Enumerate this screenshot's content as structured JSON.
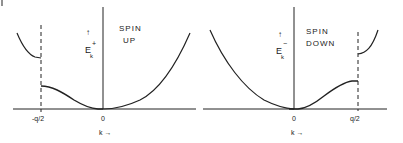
{
  "figure": {
    "corner_mark": "|",
    "left_panel": {
      "title_line1": "SPIN",
      "title_line2": "UP",
      "y_label": "E",
      "y_label_sup": "+",
      "y_label_sub": "k",
      "y_arrow": "↑",
      "x_tick_left": "-q/2",
      "x_tick_origin": "0",
      "x_label": "k →"
    },
    "right_panel": {
      "title_line1": "SPIN",
      "title_line2": "DOWN",
      "y_label": "E",
      "y_label_sup": "−",
      "y_label_sub": "k",
      "y_arrow": "↑",
      "x_tick_origin": "0",
      "x_tick_right": "q/2",
      "x_label": "k →"
    },
    "colors": {
      "line": "#222222",
      "background": "#ffffff"
    }
  }
}
